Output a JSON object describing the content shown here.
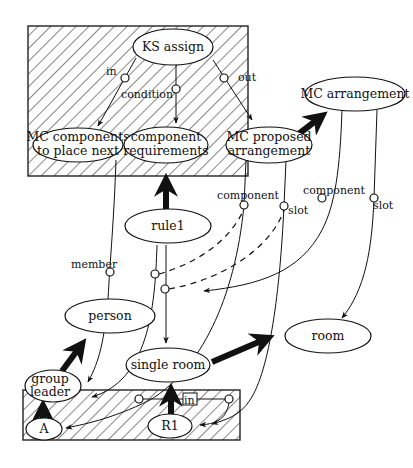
{
  "diagram": {
    "type": "semantic network / knowledge source diagram",
    "regions": [
      {
        "id": "top-context",
        "style": "hatched",
        "x": 28,
        "y": 26,
        "w": 220,
        "h": 150
      },
      {
        "id": "bottom-context",
        "style": "hatched",
        "x": 23,
        "y": 390,
        "w": 217,
        "h": 50
      }
    ],
    "nodes": {
      "ks_assign": {
        "label": "KS assign"
      },
      "mc_components": {
        "label_line1": "MC components",
        "label_line2": "to place next"
      },
      "component_requirements": {
        "label_line1": "component",
        "label_line2": "requirements"
      },
      "mc_proposed": {
        "label_line1": "MC proposed",
        "label_line2": "arrangement"
      },
      "mc_arrangement": {
        "label": "MC arrangement"
      },
      "rule1": {
        "label": "rule1"
      },
      "person": {
        "label": "person"
      },
      "room": {
        "label": "room"
      },
      "single_room": {
        "label": "single room"
      },
      "group_leader": {
        "label_line1": "group",
        "label_line2": "leader"
      },
      "a": {
        "label": "A"
      },
      "r1": {
        "label": "R1"
      }
    },
    "edge_labels": {
      "in_top": "in",
      "condition": "condition",
      "out": "out",
      "member": "member",
      "component_1": "component",
      "slot_1": "slot",
      "component_2": "component",
      "slot_2": "slot",
      "in_bottom": "in"
    },
    "edges": [
      {
        "from": "KS assign",
        "to": "MC components to place next",
        "label": "in",
        "style": "thin-arrow"
      },
      {
        "from": "KS assign",
        "to": "component requirements",
        "label": "condition",
        "style": "thin-arrow"
      },
      {
        "from": "KS assign",
        "to": "MC proposed arrangement",
        "label": "out",
        "style": "thin-arrow"
      },
      {
        "from": "MC proposed arrangement",
        "to": "MC arrangement",
        "style": "thick-arrow"
      },
      {
        "from": "rule1",
        "to": "component requirements",
        "style": "thick-arrow"
      },
      {
        "from": "single room",
        "to": "room",
        "style": "thick-arrow"
      },
      {
        "from": "group leader",
        "to": "person",
        "style": "thick-arrow"
      },
      {
        "from": "A",
        "to": "group leader",
        "style": "thick-arrow"
      },
      {
        "from": "R1",
        "to": "single room",
        "style": "thick-arrow"
      },
      {
        "from": "MC arrangement",
        "to": "person",
        "label": "component",
        "style": "thin-arrow"
      },
      {
        "from": "MC arrangement",
        "to": "room",
        "label": "slot",
        "style": "thin-arrow"
      },
      {
        "from": "rule1",
        "to": "single room",
        "style": "thin-arrow"
      },
      {
        "from": "MC components to place next",
        "to": "group leader",
        "label": "member",
        "style": "thin-arrow"
      },
      {
        "from": "MC proposed arrangement",
        "to": "A",
        "label": "component",
        "style": "thin-arrow"
      },
      {
        "from": "MC proposed arrangement",
        "to": "R1",
        "label": "slot",
        "style": "thin-arrow"
      },
      {
        "from": "rule1",
        "to": "component (MC arrangement)",
        "style": "dashed"
      },
      {
        "from": "rule1",
        "to": "slot (MC proposed)",
        "style": "dashed"
      },
      {
        "from": "single room",
        "to": "R1",
        "label": "in",
        "style": "thin-arrow"
      }
    ]
  }
}
